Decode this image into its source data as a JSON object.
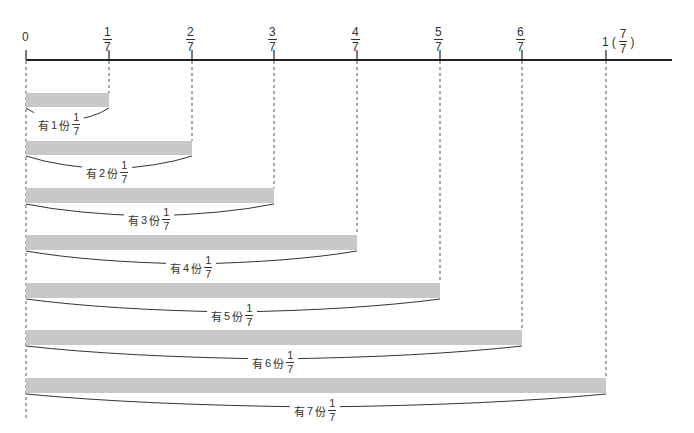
{
  "number_line": {
    "zero_label": "0",
    "ticks": [
      {
        "num": "1",
        "den": "7"
      },
      {
        "num": "2",
        "den": "7"
      },
      {
        "num": "3",
        "den": "7"
      },
      {
        "num": "4",
        "den": "7"
      },
      {
        "num": "5",
        "den": "7"
      },
      {
        "num": "6",
        "den": "7"
      }
    ],
    "one_label": {
      "whole": "1",
      "open": "(",
      "num": "7",
      "den": "7",
      "close": ")"
    }
  },
  "bars": [
    {
      "prefix": "有",
      "count": "1",
      "suffix": "份",
      "num": "1",
      "den": "7"
    },
    {
      "prefix": "有",
      "count": "2",
      "suffix": "份",
      "num": "1",
      "den": "7"
    },
    {
      "prefix": "有",
      "count": "3",
      "suffix": "份",
      "num": "1",
      "den": "7"
    },
    {
      "prefix": "有",
      "count": "4",
      "suffix": "份",
      "num": "1",
      "den": "7"
    },
    {
      "prefix": "有",
      "count": "5",
      "suffix": "份",
      "num": "1",
      "den": "7"
    },
    {
      "prefix": "有",
      "count": "6",
      "suffix": "份",
      "num": "1",
      "den": "7"
    },
    {
      "prefix": "有",
      "count": "7",
      "suffix": "份",
      "num": "1",
      "den": "7"
    }
  ],
  "colors": {
    "axis": "#222222",
    "bar_fill": "#c8c8c8",
    "dashed_guide": "#555555",
    "brace": "#333333"
  }
}
